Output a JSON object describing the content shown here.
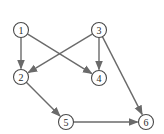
{
  "diagram": {
    "type": "directed-graph",
    "nodes": [
      {
        "id": "1",
        "label": "1",
        "x": 21,
        "y": 30
      },
      {
        "id": "2",
        "label": "2",
        "x": 21,
        "y": 77
      },
      {
        "id": "3",
        "label": "3",
        "x": 99,
        "y": 30
      },
      {
        "id": "4",
        "label": "4",
        "x": 99,
        "y": 78
      },
      {
        "id": "5",
        "label": "5",
        "x": 66,
        "y": 122
      },
      {
        "id": "6",
        "label": "6",
        "x": 146,
        "y": 122
      }
    ],
    "edges": [
      {
        "from": "1",
        "to": "2"
      },
      {
        "from": "1",
        "to": "4"
      },
      {
        "from": "3",
        "to": "2"
      },
      {
        "from": "3",
        "to": "4"
      },
      {
        "from": "3",
        "to": "6"
      },
      {
        "from": "2",
        "to": "5"
      },
      {
        "from": "5",
        "to": "6"
      }
    ],
    "colors": {
      "edge": "#6a6a6a",
      "node_stroke": "#4a4a4a"
    }
  }
}
